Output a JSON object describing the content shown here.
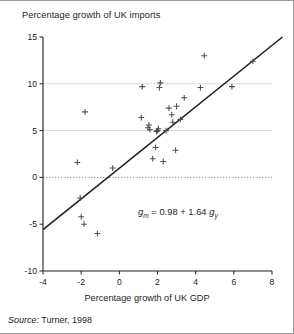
{
  "figure": {
    "source_label": "Source:",
    "source_text": " Turner, 1998"
  },
  "equation": {
    "lhs_var": "g",
    "lhs_sub": "m",
    "eq": " = 0.98 + 1.64 ",
    "rhs_var": "g",
    "rhs_sub": "y",
    "text": "gm = 0.98 + 1.64 gy",
    "intercept": 0.98,
    "slope": 1.64
  },
  "chart_data": {
    "type": "scatter",
    "title": "",
    "ylabel": "Percentage growth of UK imports",
    "xlabel": "Percentage growth of UK GDP",
    "xlim": [
      -4,
      8
    ],
    "ylim": [
      -10,
      15
    ],
    "xticks": [
      -4,
      -2,
      0,
      2,
      4,
      6,
      8
    ],
    "xtick_labels": [
      "-4",
      "-2",
      "0",
      "2",
      "4",
      "6",
      "8"
    ],
    "yticks": [
      -10,
      -5,
      0,
      5,
      10,
      15
    ],
    "ytick_labels": [
      "-10",
      "-5",
      "0",
      "5",
      "10",
      "15"
    ],
    "grid": "horizontal-gridlines-at-5-and-10-solid-light, zero-line-dashed",
    "marker": "plus",
    "marker_color": "#4d4d4d",
    "legend": "none",
    "points": [
      {
        "x": -2.2,
        "y": 1.6
      },
      {
        "x": -2.05,
        "y": -2.2
      },
      {
        "x": -2.0,
        "y": -4.2
      },
      {
        "x": -1.85,
        "y": -5.0
      },
      {
        "x": -1.8,
        "y": 7.0
      },
      {
        "x": -1.15,
        "y": -6.0
      },
      {
        "x": -0.35,
        "y": 1.0
      },
      {
        "x": 1.15,
        "y": 6.4
      },
      {
        "x": 1.2,
        "y": 9.7
      },
      {
        "x": 1.5,
        "y": 5.3
      },
      {
        "x": 1.55,
        "y": 5.6
      },
      {
        "x": 1.6,
        "y": 5.1
      },
      {
        "x": 1.75,
        "y": 2.0
      },
      {
        "x": 1.9,
        "y": 3.2
      },
      {
        "x": 1.95,
        "y": 4.9
      },
      {
        "x": 2.0,
        "y": 5.0
      },
      {
        "x": 2.05,
        "y": 5.2
      },
      {
        "x": 2.1,
        "y": 9.6
      },
      {
        "x": 2.15,
        "y": 10.1
      },
      {
        "x": 2.3,
        "y": 1.7
      },
      {
        "x": 2.45,
        "y": 5.0
      },
      {
        "x": 2.6,
        "y": 7.4
      },
      {
        "x": 2.75,
        "y": 6.7
      },
      {
        "x": 2.8,
        "y": 5.9
      },
      {
        "x": 2.95,
        "y": 2.9
      },
      {
        "x": 3.0,
        "y": 7.6
      },
      {
        "x": 3.2,
        "y": 6.2
      },
      {
        "x": 3.4,
        "y": 8.5
      },
      {
        "x": 4.25,
        "y": 9.6
      },
      {
        "x": 4.45,
        "y": 13.0
      },
      {
        "x": 5.9,
        "y": 9.7
      },
      {
        "x": 7.0,
        "y": 12.4
      }
    ],
    "fit_line": {
      "type": "linear",
      "intercept": 0.98,
      "slope": 1.64,
      "x_start": -4,
      "y_start": -5.58,
      "x_end": 8.55,
      "y_end": 15.0,
      "clipped_at_top": true
    }
  }
}
